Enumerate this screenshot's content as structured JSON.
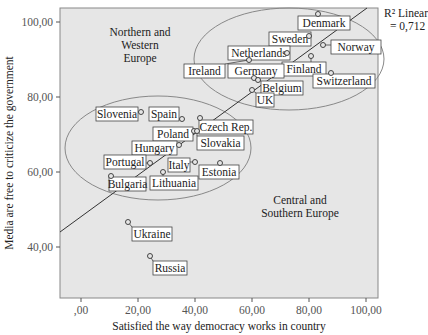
{
  "chart_data": {
    "type": "scatter",
    "title": "",
    "xlabel": "Satisfied the way democracy works in country",
    "ylabel": "Media are free to criticize the government",
    "xlim": [
      -7,
      104
    ],
    "ylim": [
      24,
      104
    ],
    "x_ticks": [
      ",00",
      "20,00",
      "40,00",
      "60,00",
      "80,00",
      "100,00"
    ],
    "x_tick_values": [
      0,
      20,
      40,
      60,
      80,
      100
    ],
    "y_ticks": [
      "40,00",
      "60,00",
      "80,00",
      "100,00"
    ],
    "y_tick_values": [
      40,
      60,
      80,
      100
    ],
    "grid": false,
    "fit_line": {
      "label": "R² Linear",
      "value": "= 0,712",
      "x0": -7,
      "y0": 44,
      "x1": 104,
      "y1": 104
    },
    "regions": [
      {
        "name": "Northern and Western Europe",
        "lines": [
          "Northern and",
          "Western",
          "Europe"
        ]
      },
      {
        "name": "Central and Southern Europe",
        "lines": [
          "Central and",
          "Southern Europe"
        ]
      }
    ],
    "points": [
      {
        "country": "Denmark",
        "x": 82,
        "y": 94
      },
      {
        "country": "Sweden",
        "x": 79,
        "y": 91
      },
      {
        "country": "Norway",
        "x": 85,
        "y": 92
      },
      {
        "country": "Netherlands",
        "x": 67,
        "y": 88
      },
      {
        "country": "Finland",
        "x": 73,
        "y": 89
      },
      {
        "country": "Ireland",
        "x": 49,
        "y": 90
      },
      {
        "country": "Germany",
        "x": 50,
        "y": 86
      },
      {
        "country": "Switzerland",
        "x": 86,
        "y": 84
      },
      {
        "country": "Belgium",
        "x": 57,
        "y": 84
      },
      {
        "country": "UK",
        "x": 50,
        "y": 83
      },
      {
        "country": "Slovenia",
        "x": 22,
        "y": 76
      },
      {
        "country": "Spain",
        "x": 35,
        "y": 74
      },
      {
        "country": "Czech Rep.",
        "x": 41,
        "y": 74
      },
      {
        "country": "Poland",
        "x": 40,
        "y": 71
      },
      {
        "country": "Slovakia",
        "x": 42,
        "y": 71
      },
      {
        "country": "Hungary",
        "x": 34,
        "y": 67
      },
      {
        "country": "Portugal",
        "x": 24,
        "y": 62
      },
      {
        "country": "Italy",
        "x": 40,
        "y": 63
      },
      {
        "country": "Estonia",
        "x": 44,
        "y": 60
      },
      {
        "country": "Lithuania",
        "x": 30,
        "y": 60
      },
      {
        "country": "Bulgaria",
        "x": 10,
        "y": 60
      },
      {
        "country": "Ukraine",
        "x": 17,
        "y": 47
      },
      {
        "country": "Russia",
        "x": 24,
        "y": 37
      }
    ]
  },
  "labels": {
    "r2_label": "R² Linear",
    "r2_value": "= 0,712",
    "xlabel": "Satisfied the way democracy works in country",
    "ylabel": "Media are free to criticize the government",
    "region_nw": [
      "Northern and",
      "Western",
      "Europe"
    ],
    "region_cs": [
      "Central and",
      "Southern Europe"
    ],
    "x_ticks": [
      ",00",
      "20,00",
      "40,00",
      "60,00",
      "80,00",
      "100,00"
    ],
    "y_ticks": [
      "40,00",
      "60,00",
      "80,00",
      "100,00"
    ]
  },
  "point_labels": [
    {
      "text": "Denmark",
      "px": 318,
      "py": 14,
      "lx": 298,
      "ly": 16,
      "w": 52
    },
    {
      "text": "Sweden",
      "px": 309,
      "py": 36,
      "lx": 269,
      "ly": 32,
      "w": 42
    },
    {
      "text": "Norway",
      "px": 323,
      "py": 45,
      "lx": 331,
      "ly": 40,
      "w": 50
    },
    {
      "text": "Netherlands",
      "px": 287,
      "py": 53,
      "lx": 228,
      "ly": 46,
      "w": 62
    },
    {
      "text": "Finland",
      "px": 311,
      "py": 56,
      "lx": 282,
      "ly": 62,
      "w": 44
    },
    {
      "text": "Ireland",
      "px": 249,
      "py": 60,
      "lx": 184,
      "ly": 64,
      "w": 41
    },
    {
      "text": "Germany",
      "px": 254,
      "py": 78,
      "lx": 228,
      "ly": 64,
      "w": 56
    },
    {
      "text": "Switzerland",
      "px": 331,
      "py": 73,
      "lx": 313,
      "ly": 74,
      "w": 62
    },
    {
      "text": "Belgium",
      "px": 258,
      "py": 80,
      "lx": 261,
      "ly": 81,
      "w": 42
    },
    {
      "text": "UK",
      "px": 252,
      "py": 90,
      "lx": 256,
      "ly": 93,
      "w": 18
    },
    {
      "text": "Slovenia",
      "px": 141,
      "py": 112,
      "lx": 96,
      "ly": 107,
      "w": 42
    },
    {
      "text": "Spain",
      "px": 182,
      "py": 119,
      "lx": 149,
      "ly": 107,
      "w": 30
    },
    {
      "text": "Czech Rep.",
      "px": 200,
      "py": 118,
      "lx": 199,
      "ly": 120,
      "w": 54
    },
    {
      "text": "Poland",
      "px": 194,
      "py": 131,
      "lx": 153,
      "ly": 127,
      "w": 40
    },
    {
      "text": "Slovakia",
      "px": 197,
      "py": 131,
      "lx": 197,
      "ly": 136,
      "w": 47
    },
    {
      "text": "Hungary",
      "px": 179,
      "py": 145,
      "lx": 132,
      "ly": 141,
      "w": 45
    },
    {
      "text": "Portugal",
      "px": 150,
      "py": 163,
      "lx": 104,
      "ly": 155,
      "w": 42
    },
    {
      "text": "Italy",
      "px": 195,
      "py": 162,
      "lx": 168,
      "ly": 158,
      "w": 22
    },
    {
      "text": "Estonia",
      "px": 220,
      "py": 163,
      "lx": 199,
      "ly": 165,
      "w": 40
    },
    {
      "text": "Lithuania",
      "px": 163,
      "py": 172,
      "lx": 150,
      "ly": 176,
      "w": 48
    },
    {
      "text": "Bulgaria",
      "px": 111,
      "py": 176,
      "lx": 109,
      "ly": 177,
      "w": 37
    },
    {
      "text": "Ukraine",
      "px": 128,
      "py": 222,
      "lx": 132,
      "ly": 227,
      "w": 40
    },
    {
      "text": "Russia",
      "px": 150,
      "py": 256,
      "lx": 153,
      "ly": 261,
      "w": 34
    }
  ]
}
